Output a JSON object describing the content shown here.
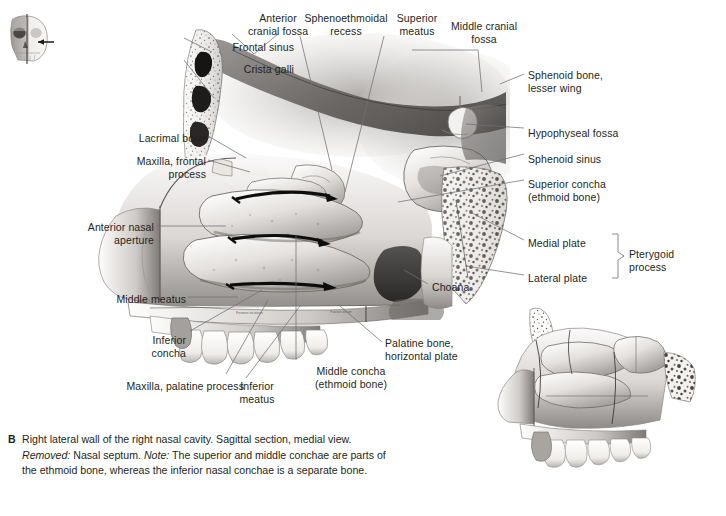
{
  "figure": {
    "id": "B",
    "type": "anatomical-illustration",
    "orientation_icon": "skull-sagittal-section-icon",
    "has_inset": true,
    "inset_description": "unlabeled lateral nasal wall, smaller scale"
  },
  "labels": [
    {
      "name": "frontal-sinus",
      "text": "Frontal sinus",
      "align": "right",
      "x": 174,
      "y": 41,
      "w": 120
    },
    {
      "name": "crista-galli",
      "text": "Crista galli",
      "align": "right",
      "x": 174,
      "y": 63,
      "w": 120
    },
    {
      "name": "anterior-cranial-fossa",
      "text": "Anterior\ncranial fossa",
      "align": "center",
      "x": 233,
      "y": 12,
      "w": 90
    },
    {
      "name": "sphenoethmoidal-recess",
      "text": "Sphenoethmoidal\nrecess",
      "align": "center",
      "x": 291,
      "y": 12,
      "w": 110
    },
    {
      "name": "superior-meatus",
      "text": "Superior\nmeatus",
      "align": "center",
      "x": 379,
      "y": 12,
      "w": 76
    },
    {
      "name": "middle-cranial-fossa",
      "text": "Middle cranial\nfossa",
      "align": "center",
      "x": 436,
      "y": 20,
      "w": 96
    },
    {
      "name": "sphenoid-bone-lesser-wing",
      "text": "Sphenoid bone,\nlesser wing",
      "align": "left",
      "x": 528,
      "y": 69,
      "w": 130
    },
    {
      "name": "hypophyseal-fossa",
      "text": "Hypophyseal fossa",
      "align": "left",
      "x": 528,
      "y": 127,
      "w": 140
    },
    {
      "name": "sphenoid-sinus",
      "text": "Sphenoid sinus",
      "align": "left",
      "x": 528,
      "y": 153,
      "w": 140
    },
    {
      "name": "superior-concha",
      "text": "Superior concha\n(ethmoid bone)",
      "align": "left",
      "x": 528,
      "y": 178,
      "w": 140
    },
    {
      "name": "medial-plate",
      "text": "Medial plate",
      "align": "left",
      "x": 528,
      "y": 237,
      "w": 90
    },
    {
      "name": "lateral-plate",
      "text": "Lateral plate",
      "align": "left",
      "x": 528,
      "y": 272,
      "w": 90
    },
    {
      "name": "pterygoid-process",
      "text": "Pterygoid\nprocess",
      "align": "left",
      "x": 629,
      "y": 248,
      "w": 90
    },
    {
      "name": "lacrimal-bone",
      "text": "Lacrimal bone",
      "align": "right",
      "x": 86,
      "y": 132,
      "w": 120
    },
    {
      "name": "maxilla-frontal-process",
      "text": "Maxilla, frontal\nprocess",
      "align": "right",
      "x": 86,
      "y": 155,
      "w": 120
    },
    {
      "name": "anterior-nasal-aperture",
      "text": "Anterior nasal\naperture",
      "align": "right",
      "x": 34,
      "y": 221,
      "w": 120
    },
    {
      "name": "middle-meatus",
      "text": "Middle meatus",
      "align": "right",
      "x": 66,
      "y": 293,
      "w": 120
    },
    {
      "name": "inferior-concha",
      "text": "Inferior\nconcha",
      "align": "right",
      "x": 100,
      "y": 334,
      "w": 86
    },
    {
      "name": "maxilla-palatine-process",
      "text": "Maxilla, palatine process",
      "align": "right",
      "x": 84,
      "y": 380,
      "w": 160
    },
    {
      "name": "inferior-meatus",
      "text": "Inferior\nmeatus",
      "align": "center",
      "x": 222,
      "y": 380,
      "w": 70
    },
    {
      "name": "middle-concha",
      "text": "Middle concha\n(ethmoid bone)",
      "align": "center",
      "x": 296,
      "y": 365,
      "w": 110
    },
    {
      "name": "palatine-bone-horizontal-plate",
      "text": "Palatine bone,\nhorizontal plate",
      "align": "left",
      "x": 385,
      "y": 337,
      "w": 120
    },
    {
      "name": "choana",
      "text": "Choana",
      "align": "left",
      "x": 432,
      "y": 281,
      "w": 70
    }
  ],
  "caption": {
    "letter": "B",
    "line1": "Right lateral wall of the right nasal cavity. Sagittal section, medial",
    "view_word": "view.",
    "removed_label": "Removed:",
    "removed_text": "Nasal septum.",
    "note_label": "Note:",
    "note_text": "The superior and middle conchae",
    "line3": "are parts of the ethmoid bone, whereas the inferior nasal conchae is",
    "line4": "a separate bone."
  },
  "colors": {
    "background": "#ffffff",
    "text": "#231f20",
    "leader_line": "#6f6f74",
    "arrow": "#0d0d0d",
    "bone_light": "#f2f0ee",
    "bone_mid": "#c9c5c2",
    "bone_dark": "#6e6b69"
  }
}
